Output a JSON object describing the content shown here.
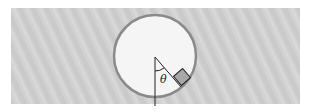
{
  "diagram": {
    "type": "physics-figure",
    "labels": {
      "angle": "θ"
    },
    "colors": {
      "background": "#ffffff",
      "surface": "#d2d2d2",
      "circle_fill": "#f5f5f5",
      "circle_stroke": "#8a8a8a",
      "block_fill": "#a8a8a8",
      "line": "#222222"
    },
    "geometry": {
      "surface": {
        "x": 11,
        "y": 8,
        "width": 289,
        "height": 96
      },
      "circle": {
        "cx": 155,
        "cy": 56,
        "r": 41
      },
      "vertical_line": {
        "x": 155,
        "y1": 57,
        "y2": 106
      },
      "theta_deg": 40
    }
  }
}
